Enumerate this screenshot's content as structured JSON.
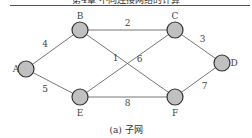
{
  "header": {
    "text": "第4章 不同连接网络的计算"
  },
  "diagram": {
    "caption": "(a) 子网",
    "node_fill": "#c0c0c0",
    "node_stroke": "#333333",
    "edge_color": "#666666",
    "nodes": [
      {
        "id": "A",
        "label": "A",
        "x": 26,
        "y": 69
      },
      {
        "id": "B",
        "label": "B",
        "x": 80,
        "y": 30
      },
      {
        "id": "C",
        "label": "C",
        "x": 175,
        "y": 30
      },
      {
        "id": "D",
        "label": "D",
        "x": 222,
        "y": 63
      },
      {
        "id": "E",
        "label": "E",
        "x": 80,
        "y": 97
      },
      {
        "id": "F",
        "label": "F",
        "x": 175,
        "y": 97
      }
    ],
    "edges": [
      {
        "from": "A",
        "to": "B",
        "weight": "4"
      },
      {
        "from": "A",
        "to": "E",
        "weight": "5"
      },
      {
        "from": "B",
        "to": "C",
        "weight": "2"
      },
      {
        "from": "B",
        "to": "F",
        "weight": "6"
      },
      {
        "from": "E",
        "to": "C",
        "weight": "1"
      },
      {
        "from": "E",
        "to": "F",
        "weight": "8"
      },
      {
        "from": "C",
        "to": "D",
        "weight": "3"
      },
      {
        "from": "F",
        "to": "D",
        "weight": "7"
      }
    ]
  }
}
